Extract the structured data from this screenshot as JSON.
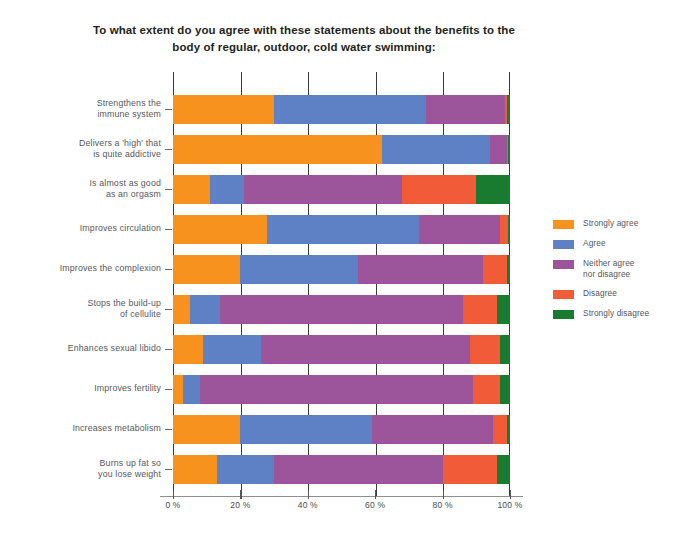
{
  "chart_data": {
    "type": "bar",
    "subtype": "stacked-horizontal-100",
    "title_line1": "To what extent do you agree with these statements about the benefits to the",
    "title_line2": "body of regular, outdoor, cold water swimming:",
    "xlabel": "",
    "ylabel": "",
    "xlim": [
      0,
      100
    ],
    "xticks": [
      0,
      20,
      40,
      60,
      80,
      100
    ],
    "xticklabels": [
      "0 %",
      "20 %",
      "40 %",
      "60 %",
      "80 %",
      "100 %"
    ],
    "grid": "vertical",
    "legend_position": "right",
    "categories": [
      [
        "Strengthens the",
        "immune system"
      ],
      [
        "Delivers a 'high' that",
        "is quite addictive"
      ],
      [
        "Is almost as good",
        "as an orgasm"
      ],
      [
        "Improves circulation"
      ],
      [
        "Improves the complexion"
      ],
      [
        "Stops the build-up",
        "of cellulite"
      ],
      [
        "Enhances sexual libido"
      ],
      [
        "Improves fertility"
      ],
      [
        "Increases metabolism"
      ],
      [
        "Burns up fat so",
        "you lose weight"
      ]
    ],
    "series": [
      {
        "name": "Strongly agree",
        "color": "#F7921E",
        "values": [
          30,
          62,
          11,
          28,
          20,
          5,
          9,
          3,
          20,
          13
        ]
      },
      {
        "name_line1": "Agree",
        "name": "Agree",
        "color": "#5E80C4",
        "values": [
          45,
          32,
          10,
          45,
          35,
          9,
          17,
          5,
          39,
          17
        ]
      },
      {
        "name": "Neither agree nor disagree",
        "name_line1": "Neither agree",
        "name_line2": "nor disagree",
        "color": "#9C559B",
        "values": [
          23.5,
          5,
          47,
          24,
          37,
          72,
          62,
          81,
          36,
          50
        ]
      },
      {
        "name": "Disagree",
        "color": "#F15B38",
        "values": [
          0.5,
          0.5,
          22,
          2.5,
          7,
          10,
          9,
          8,
          4,
          16
        ]
      },
      {
        "name": "Strongly disagree",
        "color": "#197B30",
        "values": [
          1,
          0.5,
          10,
          0.5,
          1,
          4,
          3,
          3,
          1,
          4
        ]
      }
    ]
  }
}
